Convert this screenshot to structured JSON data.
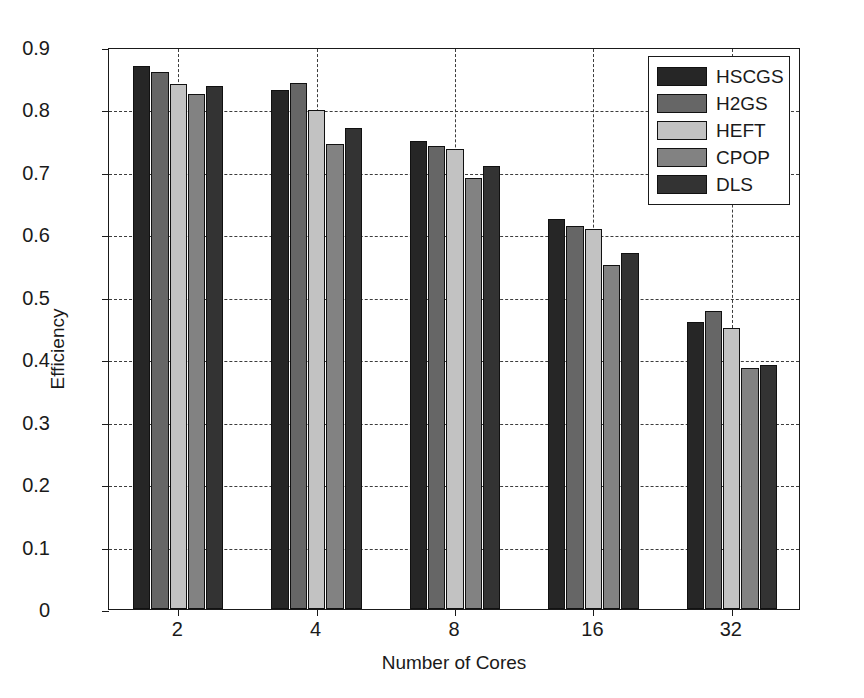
{
  "chart_data": {
    "type": "bar",
    "title": "",
    "xlabel": "Number of Cores",
    "ylabel": "Efficiency",
    "categories": [
      "2",
      "4",
      "8",
      "16",
      "32"
    ],
    "ylim": [
      0,
      0.9
    ],
    "yticks": [
      "0",
      "0.1",
      "0.2",
      "0.3",
      "0.4",
      "0.5",
      "0.6",
      "0.7",
      "0.8",
      "0.9"
    ],
    "ytick_values": [
      0,
      0.1,
      0.2,
      0.3,
      0.4,
      0.5,
      0.6,
      0.7,
      0.8,
      0.9
    ],
    "grid": "dashed both axes",
    "legend_position": "top-right inside",
    "series": [
      {
        "name": "HSCGS",
        "color": "#262626",
        "values": [
          0.87,
          0.831,
          0.75,
          0.625,
          0.46
        ]
      },
      {
        "name": "H2GS",
        "color": "#666666",
        "values": [
          0.86,
          0.842,
          0.742,
          0.613,
          0.477
        ]
      },
      {
        "name": "HEFT",
        "color": "#c2c2c2",
        "values": [
          0.841,
          0.799,
          0.737,
          0.608,
          0.45
        ]
      },
      {
        "name": "CPOP",
        "color": "#828282",
        "values": [
          0.824,
          0.745,
          0.69,
          0.551,
          0.386
        ]
      },
      {
        "name": "DLS",
        "color": "#333333",
        "values": [
          0.837,
          0.77,
          0.71,
          0.57,
          0.39
        ]
      }
    ]
  },
  "axes": {
    "y_title": "Efficiency",
    "x_title": "Number of Cores"
  },
  "colors": {
    "axis": "#1a1a1a",
    "grid": "#3d3d3d",
    "background": "#ffffff"
  }
}
